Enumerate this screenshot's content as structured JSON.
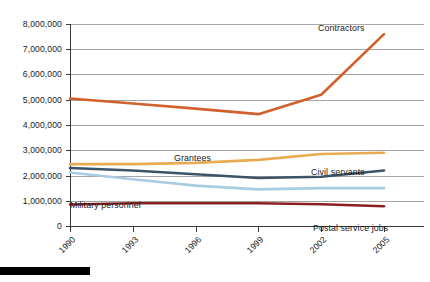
{
  "chart_data": {
    "type": "line",
    "title": "",
    "subtitle": "",
    "xlabel": "",
    "ylabel": "",
    "grid": true,
    "legend_position": "inline-labels",
    "x": [
      1990,
      1993,
      1996,
      1999,
      2002,
      2005
    ],
    "categories": [
      "1990",
      "1993",
      "1996",
      "1999",
      "2002",
      "2005"
    ],
    "ylim": [
      0,
      8000000
    ],
    "ytick_values": [
      0,
      1000000,
      2000000,
      3000000,
      4000000,
      5000000,
      6000000,
      7000000,
      8000000
    ],
    "ytick_labels": [
      "0",
      "1,000,000",
      "2,000,000",
      "3,000,000",
      "4,000,000",
      "5,000,000",
      "6,000,000",
      "7,000,000",
      "8,000,000"
    ],
    "series": [
      {
        "name": "Contractors",
        "color": "#d2602c",
        "label_x": 2002,
        "values": [
          5050000,
          4850000,
          4650000,
          4430000,
          5200000,
          7600000
        ]
      },
      {
        "name": "Grantees",
        "color": "#e8ab52",
        "label_x": 1996,
        "values": [
          2450000,
          2450000,
          2500000,
          2620000,
          2850000,
          2900000
        ]
      },
      {
        "name": "Civil servants",
        "color": "#3c5468",
        "label_x": 2002,
        "values": [
          2300000,
          2200000,
          2050000,
          1900000,
          1950000,
          2200000
        ]
      },
      {
        "name": "Military personnel",
        "color": "#a8cde2",
        "label_x": 1990,
        "values": [
          2120000,
          1850000,
          1600000,
          1450000,
          1500000,
          1500000
        ]
      },
      {
        "name": "Postal service jobs",
        "color": "#8a1f23",
        "label_x": 2002,
        "values": [
          850000,
          900000,
          900000,
          900000,
          860000,
          780000
        ]
      }
    ],
    "annotations": [
      {
        "text": "Contractors",
        "x_px": 318,
        "y_px": 31
      },
      {
        "text": "Grantees",
        "x_px": 174,
        "y_px": 161
      },
      {
        "text": "Civil servants",
        "x_px": 311,
        "y_px": 175
      },
      {
        "text": "Military personnel",
        "x_px": 70,
        "y_px": 208
      },
      {
        "text": "Postal service jobs",
        "x_px": 313,
        "y_px": 231
      }
    ]
  },
  "axes": {
    "y_labels": [
      "8,000,000",
      "7,000,000",
      "6,000,000",
      "5,000,000",
      "4,000,000",
      "3,000,000",
      "2,000,000",
      "1,000,000",
      "0"
    ],
    "x_labels": [
      "1990",
      "1993",
      "1996",
      "1999",
      "2002",
      "2005"
    ]
  },
  "colors": {
    "contractors": "#d2602c",
    "grantees": "#e8ab52",
    "civil_servants": "#3c5468",
    "military_personnel": "#a8cde2",
    "postal_service": "#8a1f23",
    "gridline": "#8e8e8e",
    "axis": "#3a3a3a",
    "background": "#ffffff",
    "footer_bar": "#000000"
  }
}
